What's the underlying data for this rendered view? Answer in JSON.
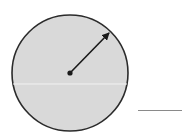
{
  "diagram": {
    "type": "circle-with-radius",
    "circle": {
      "center": {
        "x": 70,
        "y": 73
      },
      "radius": 58,
      "fill_color": "#d9d9d9",
      "stroke_color": "#2b2b2b",
      "stroke_width": 1.6
    },
    "center_point": {
      "x": 70,
      "y": 73,
      "radius": 2.6,
      "color": "#1a1a1a"
    },
    "radius_arrow": {
      "from": {
        "x": 70,
        "y": 73
      },
      "to": {
        "x": 110,
        "y": 32
      },
      "color": "#1a1a1a",
      "stroke_width": 1.6
    },
    "scan_line": {
      "y": 84,
      "color": "#f2f2f2"
    },
    "answer_blank": {
      "x1": 138,
      "x2": 182,
      "y": 110,
      "color": "#8a8a8a"
    }
  }
}
